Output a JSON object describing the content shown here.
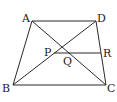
{
  "diagram": {
    "type": "geometry",
    "shape": "trapezoid",
    "points": {
      "A": {
        "label": "A",
        "x": 32,
        "y": 21
      },
      "D": {
        "label": "D",
        "x": 96,
        "y": 21
      },
      "B": {
        "label": "B",
        "x": 13,
        "y": 85
      },
      "C": {
        "label": "C",
        "x": 106,
        "y": 85
      },
      "P": {
        "label": "P",
        "x": 54,
        "y": 53
      },
      "Q": {
        "label": "Q",
        "x": 65,
        "y": 53
      },
      "R": {
        "label": "R",
        "x": 101,
        "y": 53
      }
    },
    "segments": [
      "AD",
      "BC",
      "AB",
      "DC",
      "AC",
      "BD",
      "PR"
    ]
  }
}
